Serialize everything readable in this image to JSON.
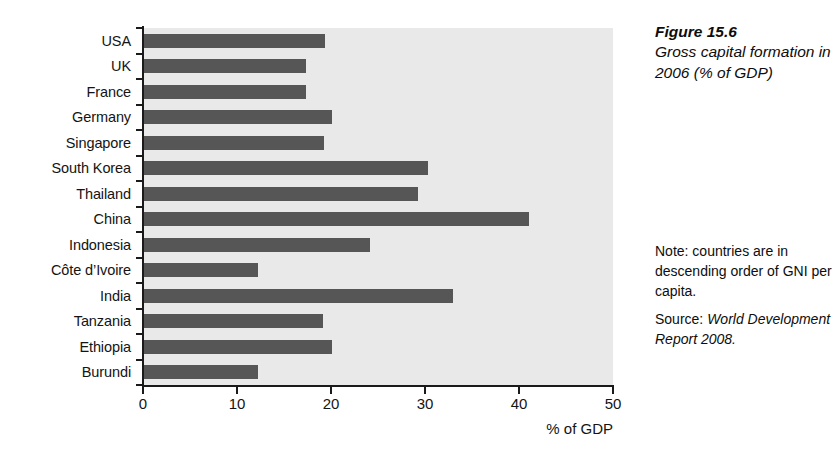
{
  "figure": {
    "number": "Figure 15.6",
    "title": "Gross capital formation in 2006 (% of GDP)",
    "note": "Note: countries are in descending order of GNI per capita.",
    "source_label": "Source:",
    "source_title": "World Development Report 2008."
  },
  "colors": {
    "bar": "#565656",
    "plot_background": "#e9e9e9",
    "axis": "#1a1a1a",
    "text": "#0d0d0d"
  },
  "chart_data": {
    "type": "bar",
    "orientation": "horizontal",
    "title": "Gross capital formation in 2006 (% of GDP)",
    "xlabel": "% of GDP",
    "ylabel": "",
    "xlim": [
      0,
      50
    ],
    "xticks": [
      0,
      10,
      20,
      30,
      40,
      50
    ],
    "xtick_labels": [
      "0",
      "10",
      "20",
      "30",
      "40",
      "50"
    ],
    "grid": false,
    "legend": false,
    "categories": [
      "USA",
      "UK",
      "France",
      "Germany",
      "Singapore",
      "South Korea",
      "Thailand",
      "China",
      "Indonesia",
      "Côte d’Ivoire",
      "India",
      "Tanzania",
      "Ethiopia",
      "Burundi"
    ],
    "values": [
      19.4,
      17.3,
      17.3,
      20.1,
      19.3,
      30.3,
      29.3,
      41.1,
      24.2,
      12.2,
      33.0,
      19.1,
      20.1,
      12.2
    ]
  }
}
